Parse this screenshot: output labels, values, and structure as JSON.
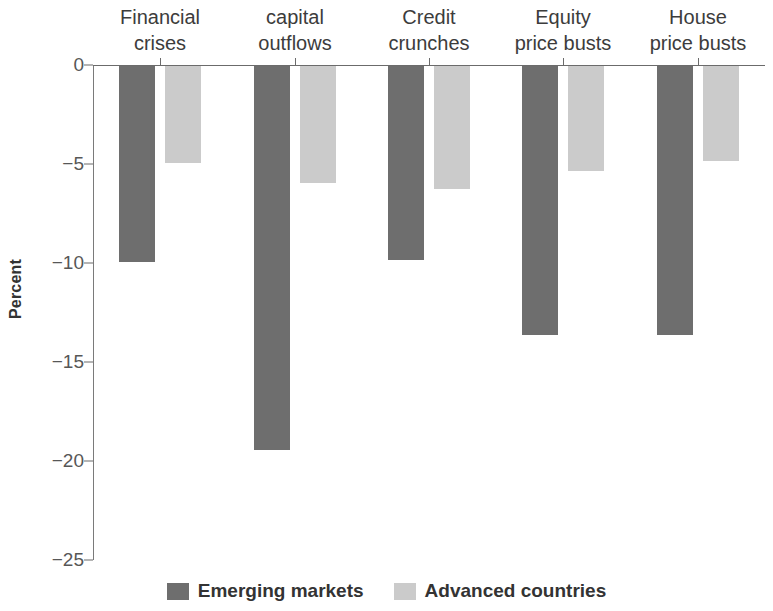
{
  "chart_data": {
    "type": "bar",
    "title": "",
    "subtitle": "",
    "xlabel": "",
    "ylabel": "Percent",
    "ylim": [
      -25,
      0
    ],
    "yticks": [
      0,
      -5,
      -10,
      -15,
      -20,
      -25
    ],
    "ytick_labels": [
      "0",
      "−5",
      "−10",
      "−15",
      "−20",
      "−25"
    ],
    "grid": false,
    "legend_position": "bottom",
    "categories": [
      "Financial crises",
      "capital outflows",
      "Credit crunches",
      "Equity price busts",
      "House price busts"
    ],
    "category_lines": [
      [
        "Financial",
        "crises"
      ],
      [
        "capital",
        "outflows"
      ],
      [
        "Credit",
        "crunches"
      ],
      [
        "Equity",
        "price busts"
      ],
      [
        "House",
        "price busts"
      ]
    ],
    "series": [
      {
        "name": "Emerging markets",
        "color": "#6e6e6e",
        "values": [
          -9.9,
          -19.4,
          -9.8,
          -13.6,
          -13.6
        ]
      },
      {
        "name": "Advanced countries",
        "color": "#cbcbcb",
        "values": [
          -4.9,
          -5.9,
          -6.2,
          -5.3,
          -4.8
        ]
      }
    ]
  },
  "legend": {
    "items": [
      {
        "label": "Emerging markets",
        "color": "#6e6e6e"
      },
      {
        "label": "Advanced countries",
        "color": "#cbcbcb"
      }
    ]
  },
  "colors": {
    "emerging": "#6e6e6e",
    "advanced": "#cbcbcb",
    "axis": "#6b6b6b",
    "text": "#3a3a3a",
    "background": "#ffffff"
  }
}
